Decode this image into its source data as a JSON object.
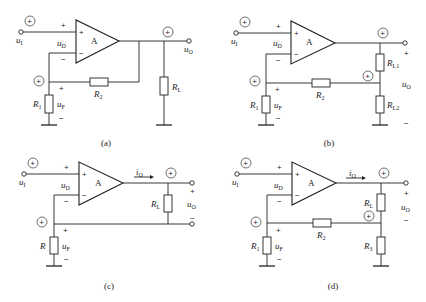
{
  "figure": {
    "circuits": [
      {
        "id": "a",
        "caption": "(a)",
        "amp_label": "A",
        "input_label": "u",
        "input_sub": "I",
        "diff_label": "u",
        "diff_sub": "D",
        "feedback_voltage_label": "u",
        "feedback_voltage_sub": "F",
        "output_label": "u",
        "output_sub": "O",
        "resistors": [
          {
            "name": "R",
            "sub": "1"
          },
          {
            "name": "R",
            "sub": "2"
          },
          {
            "name": "R",
            "sub": "L"
          }
        ],
        "polarity_markers": [
          "+",
          "+",
          "+"
        ],
        "signs": {
          "plus": "+",
          "minus": "−"
        }
      },
      {
        "id": "b",
        "caption": "(b)",
        "amp_label": "A",
        "input_label": "u",
        "input_sub": "I",
        "diff_label": "u",
        "diff_sub": "D",
        "feedback_voltage_label": "u",
        "feedback_voltage_sub": "F",
        "output_label": "u",
        "output_sub": "O",
        "resistors": [
          {
            "name": "R",
            "sub": "1"
          },
          {
            "name": "R",
            "sub": "2"
          },
          {
            "name": "R",
            "sub": "L1"
          },
          {
            "name": "R",
            "sub": "L2"
          }
        ],
        "polarity_markers": [
          "+",
          "+",
          "+",
          "+"
        ],
        "signs": {
          "plus": "+",
          "minus": "−"
        }
      },
      {
        "id": "c",
        "caption": "(c)",
        "amp_label": "A",
        "input_label": "u",
        "input_sub": "I",
        "diff_label": "u",
        "diff_sub": "D",
        "feedback_voltage_label": "u",
        "feedback_voltage_sub": "F",
        "output_label": "u",
        "output_sub": "O",
        "current_label": "i",
        "current_sub": "O",
        "resistors": [
          {
            "name": "R",
            "sub": ""
          },
          {
            "name": "R",
            "sub": "L"
          }
        ],
        "polarity_markers": [
          "+",
          "+",
          "+"
        ],
        "signs": {
          "plus": "+",
          "minus": "−"
        }
      },
      {
        "id": "d",
        "caption": "(d)",
        "amp_label": "A",
        "input_label": "u",
        "input_sub": "I",
        "diff_label": "u",
        "diff_sub": "D",
        "feedback_voltage_label": "u",
        "feedback_voltage_sub": "F",
        "output_label": "u",
        "output_sub": "O",
        "current_label": "i",
        "current_sub": "O",
        "resistors": [
          {
            "name": "R",
            "sub": "1"
          },
          {
            "name": "R",
            "sub": "2"
          },
          {
            "name": "R",
            "sub": "L"
          },
          {
            "name": "R",
            "sub": "3"
          }
        ],
        "polarity_markers": [
          "+",
          "+",
          "+",
          "+"
        ],
        "signs": {
          "plus": "+",
          "minus": "−"
        }
      }
    ]
  }
}
